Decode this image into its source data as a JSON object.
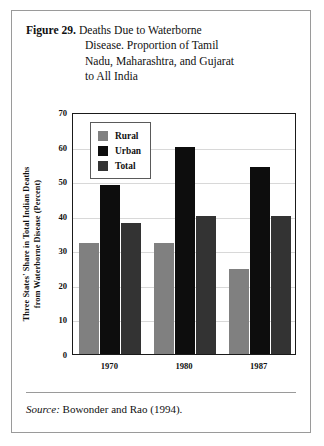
{
  "figure": {
    "label": "Figure 29.",
    "title_lines": [
      "Deaths Due to Waterborne",
      "Disease. Proportion of Tamil",
      "Nadu, Maharashtra, and Gujarat",
      "to All India"
    ],
    "source_prefix": "Source:",
    "source_text": "Bowonder and Rao (1994)."
  },
  "colors": {
    "rural": "#808080",
    "urban": "#0d0d0d",
    "total": "#333333",
    "frame": "#1a1a1a",
    "grid": "#d8d8d8",
    "border": "#9a9a9a"
  },
  "chart_data": {
    "type": "bar",
    "title": "Figure 29. Deaths Due to Waterborne Disease. Proportion of Tamil Nadu, Maharashtra, and Gujarat to All India",
    "xlabel": "",
    "ylabel": "Three States' Share in Total Indian Deaths from Waterborne Disease (Percent)",
    "ylabel_lines": [
      "Three States' Share in Total Indian Deaths",
      "from Waterborne Disease (Percent)"
    ],
    "categories": [
      "1970",
      "1980",
      "1987"
    ],
    "series": [
      {
        "name": "Rural",
        "values": [
          32,
          32,
          24.5
        ],
        "color": "#808080"
      },
      {
        "name": "Urban",
        "values": [
          49,
          60,
          54
        ],
        "color": "#0d0d0d"
      },
      {
        "name": "Total",
        "values": [
          38,
          40,
          40
        ],
        "color": "#333333"
      }
    ],
    "ylim": [
      0,
      70
    ],
    "yticks": [
      0,
      10,
      20,
      30,
      40,
      50,
      60,
      70
    ],
    "ytick_labels": [
      "0",
      "10",
      "20",
      "30",
      "40",
      "50",
      "60",
      "70"
    ],
    "grid": true,
    "legend_position": "upper-left"
  }
}
